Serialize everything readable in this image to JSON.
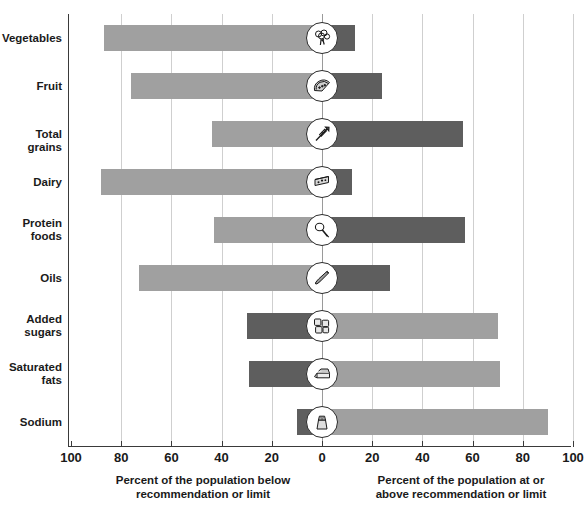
{
  "chart_data": {
    "type": "bar",
    "subtype": "diverging-horizontal-bar",
    "title": "",
    "xlabel_left": "Percent of the population below\nrecommendation or limit",
    "xlabel_right": "Percent of the population at or\nabove recommendation or limit",
    "ylabel": "",
    "xlim": [
      -100,
      100
    ],
    "xticks": [
      -100,
      -80,
      -60,
      -40,
      -20,
      0,
      20,
      40,
      60,
      80,
      100
    ],
    "xticklabels": [
      "100",
      "80",
      "60",
      "40",
      "20",
      "0",
      "20",
      "40",
      "60",
      "80",
      "100"
    ],
    "grid": true,
    "legend": "none",
    "categories": [
      "Vegetables",
      "Fruit",
      "Total grains",
      "Dairy",
      "Protein\nfoods",
      "Oils",
      "Added\nsugars",
      "Saturated\nfats",
      "Sodium"
    ],
    "series": [
      {
        "name": "Percent of the population below recommendation or limit",
        "side": "left",
        "values": [
          87,
          76,
          44,
          88,
          43,
          73,
          30,
          29,
          10
        ]
      },
      {
        "name": "Percent of the population at or above recommendation or limit",
        "side": "right",
        "values": [
          13,
          24,
          56,
          12,
          57,
          27,
          70,
          71,
          90
        ]
      }
    ],
    "colors": {
      "light_gray": "#a0a0a0",
      "dark_gray": "#5e5e5e",
      "axis": "#3a3a3a",
      "gridline": "#cfcfcf",
      "background": "#ffffff",
      "text": "#1a1a1a"
    }
  },
  "rows": [
    {
      "label": "Vegetables",
      "left_value": 87,
      "right_value": 13,
      "left_color": "light",
      "right_color": "dark",
      "icon": "broccoli-icon"
    },
    {
      "label": "Fruit",
      "left_value": 76,
      "right_value": 24,
      "left_color": "light",
      "right_color": "dark",
      "icon": "watermelon-slice-icon"
    },
    {
      "label": "Total grains",
      "left_value": 44,
      "right_value": 56,
      "left_color": "light",
      "right_color": "dark",
      "icon": "wheat-stalk-icon"
    },
    {
      "label": "Dairy",
      "left_value": 88,
      "right_value": 12,
      "left_color": "light",
      "right_color": "dark",
      "icon": "cheese-wedge-icon"
    },
    {
      "label": "Protein\nfoods",
      "left_value": 43,
      "right_value": 57,
      "left_color": "light",
      "right_color": "dark",
      "icon": "drumstick-icon"
    },
    {
      "label": "Oils",
      "left_value": 73,
      "right_value": 27,
      "left_color": "light",
      "right_color": "dark",
      "icon": "oil-bottle-icon"
    },
    {
      "label": "Added\nsugars",
      "left_value": 30,
      "right_value": 70,
      "left_color": "dark",
      "right_color": "light",
      "icon": "sugar-cubes-icon"
    },
    {
      "label": "Saturated\nfats",
      "left_value": 29,
      "right_value": 71,
      "left_color": "dark",
      "right_color": "light",
      "icon": "butter-stick-icon"
    },
    {
      "label": "Sodium",
      "left_value": 10,
      "right_value": 90,
      "left_color": "dark",
      "right_color": "light",
      "icon": "salt-shaker-icon"
    }
  ],
  "axis": {
    "ticks": [
      "100",
      "80",
      "60",
      "40",
      "20",
      "0",
      "20",
      "40",
      "60",
      "80",
      "100"
    ]
  },
  "captions": {
    "left": "Percent of the population below\nrecommendation or limit",
    "right": "Percent of the population at or\nabove recommendation or limit"
  }
}
